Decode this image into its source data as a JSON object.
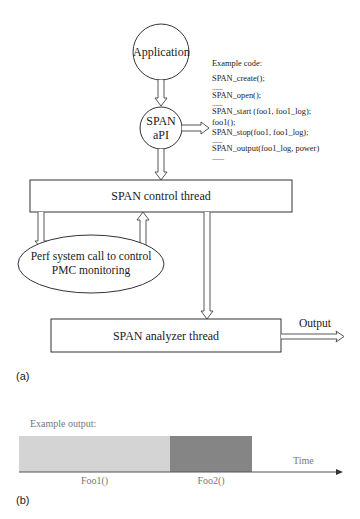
{
  "diagram_a": {
    "panel_label": "(a)",
    "nodes": {
      "application": "Application",
      "span_api_line1": "SPAN",
      "span_api_line2": "aPI",
      "control_thread": "SPAN control thread",
      "perf_line1": "Perf system call to control",
      "perf_line2": "PMC monitoring",
      "analyzer_thread": "SPAN analyzer thread",
      "output": "Output"
    },
    "example_code": {
      "title": "Example code:",
      "lines": [
        "SPAN_create();",
        ".......",
        "SPAN_open();",
        ".......",
        "SPAN_start (foo1, foo1_log);",
        "foo1();",
        "SPAN_stop(foo1, foo1_log);",
        ".......",
        "SPAN_output(foo1_log, power)",
        "........"
      ]
    },
    "edges": [
      {
        "from": "Application",
        "to": "SPAN aPI"
      },
      {
        "from": "SPAN aPI",
        "to": "Example code"
      },
      {
        "from": "SPAN aPI",
        "to": "SPAN control thread"
      },
      {
        "from": "SPAN control thread",
        "to": "Perf system call to control PMC monitoring"
      },
      {
        "from": "Perf system call to control PMC monitoring",
        "to": "SPAN control thread"
      },
      {
        "from": "SPAN control thread",
        "to": "SPAN analyzer thread"
      },
      {
        "from": "SPAN analyzer thread",
        "to": "Output"
      }
    ]
  },
  "diagram_b": {
    "panel_label": "(b)",
    "title": "Example output:",
    "axis_label": "Time",
    "segments": [
      {
        "label": "Foo1()",
        "color": "#d4d4d4"
      },
      {
        "label": "Foo2()",
        "color": "#858585"
      }
    ]
  }
}
